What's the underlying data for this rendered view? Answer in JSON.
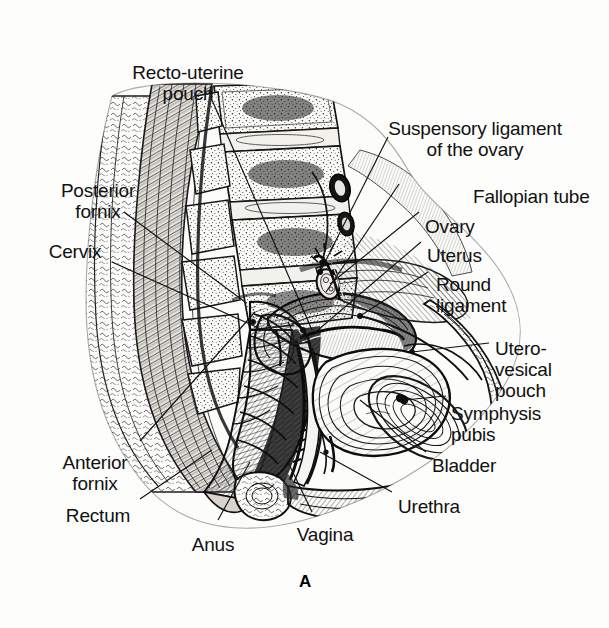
{
  "figure": {
    "panel_letter": "A",
    "background_color": "#fdfdfc",
    "ink_color": "#111111"
  },
  "labels": [
    {
      "id": "recto-uterine-pouch",
      "lines": [
        "Recto-uterine",
        "pouch"
      ],
      "x": 188,
      "y": 62,
      "align": "center"
    },
    {
      "id": "posterior-fornix",
      "lines": [
        "Posterior",
        "fornix"
      ],
      "x": 98,
      "y": 180,
      "align": "center"
    },
    {
      "id": "cervix",
      "lines": [
        "Cervix"
      ],
      "x": 75,
      "y": 241,
      "align": "center"
    },
    {
      "id": "anterior-fornix",
      "lines": [
        "Anterior",
        "fornix"
      ],
      "x": 95,
      "y": 452,
      "align": "center"
    },
    {
      "id": "rectum",
      "lines": [
        "Rectum"
      ],
      "x": 98,
      "y": 505,
      "align": "center"
    },
    {
      "id": "anus",
      "lines": [
        "Anus"
      ],
      "x": 213,
      "y": 534,
      "align": "center"
    },
    {
      "id": "vagina",
      "lines": [
        "Vagina"
      ],
      "x": 325,
      "y": 524,
      "align": "center"
    },
    {
      "id": "suspensory-ligament-of-the-ovary",
      "lines": [
        "Suspensory ligament",
        "of the ovary"
      ],
      "x": 475,
      "y": 118,
      "align": "center"
    },
    {
      "id": "fallopian-tube",
      "lines": [
        "Fallopian tube"
      ],
      "x": 473,
      "y": 186,
      "align": "left-anchor"
    },
    {
      "id": "ovary",
      "lines": [
        "Ovary"
      ],
      "x": 425,
      "y": 216,
      "align": "left-anchor"
    },
    {
      "id": "uterus",
      "lines": [
        "Uterus"
      ],
      "x": 427,
      "y": 245,
      "align": "left-anchor"
    },
    {
      "id": "round-ligament",
      "lines": [
        "Round",
        "ligament"
      ],
      "x": 436,
      "y": 274,
      "align": "left-anchor"
    },
    {
      "id": "utero-vesical-pouch",
      "lines": [
        "Utero-",
        "vesical",
        "pouch"
      ],
      "x": 495,
      "y": 338,
      "align": "left-anchor"
    },
    {
      "id": "symphysis-pubis",
      "lines": [
        "Symphysis",
        "pubis"
      ],
      "x": 451,
      "y": 403,
      "align": "left-anchor"
    },
    {
      "id": "bladder",
      "lines": [
        "Bladder"
      ],
      "x": 432,
      "y": 455,
      "align": "left-anchor"
    },
    {
      "id": "urethra",
      "lines": [
        "Urethra"
      ],
      "x": 398,
      "y": 496,
      "align": "left-anchor"
    }
  ],
  "leader_lines": [
    {
      "id": "leader-recto-uterine-pouch",
      "from": [
        212,
        100
      ],
      "to": [
        312,
        330
      ]
    },
    {
      "id": "leader-posterior-fornix",
      "from": [
        124,
        212
      ],
      "to": [
        245,
        302
      ]
    },
    {
      "id": "leader-cervix",
      "from": [
        112,
        262
      ],
      "to": [
        263,
        330
      ]
    },
    {
      "id": "leader-anterior-fornix",
      "from": [
        140,
        441
      ],
      "to": [
        255,
        312
      ]
    },
    {
      "id": "leader-rectum",
      "from": [
        140,
        499
      ],
      "to": [
        212,
        450
      ]
    },
    {
      "id": "leader-anus",
      "from": [
        218,
        520
      ],
      "to": [
        250,
        462
      ]
    },
    {
      "id": "leader-vagina",
      "from": [
        312,
        512
      ],
      "to": [
        288,
        462
      ]
    },
    {
      "id": "leader-suspensory-ligament",
      "from": [
        388,
        137
      ],
      "to": [
        320,
        272
      ]
    },
    {
      "id": "leader-fallopian-tube",
      "from": [
        399,
        184
      ],
      "to": [
        326,
        292
      ]
    },
    {
      "id": "leader-ovary",
      "from": [
        419,
        212
      ],
      "to": [
        330,
        284
      ]
    },
    {
      "id": "leader-uterus",
      "from": [
        421,
        242
      ],
      "to": [
        318,
        330
      ]
    },
    {
      "id": "leader-round-ligament",
      "from": [
        428,
        272
      ],
      "to": [
        360,
        316
      ]
    },
    {
      "id": "leader-utero-vesical-pouch",
      "from": [
        489,
        343
      ],
      "to": [
        412,
        352
      ]
    },
    {
      "id": "leader-symphysis-pubis",
      "from": [
        446,
        396
      ],
      "to": [
        404,
        400
      ]
    },
    {
      "id": "leader-bladder",
      "from": [
        426,
        452
      ],
      "to": [
        360,
        400
      ]
    },
    {
      "id": "leader-urethra",
      "from": [
        392,
        492
      ],
      "to": [
        320,
        452
      ]
    }
  ]
}
